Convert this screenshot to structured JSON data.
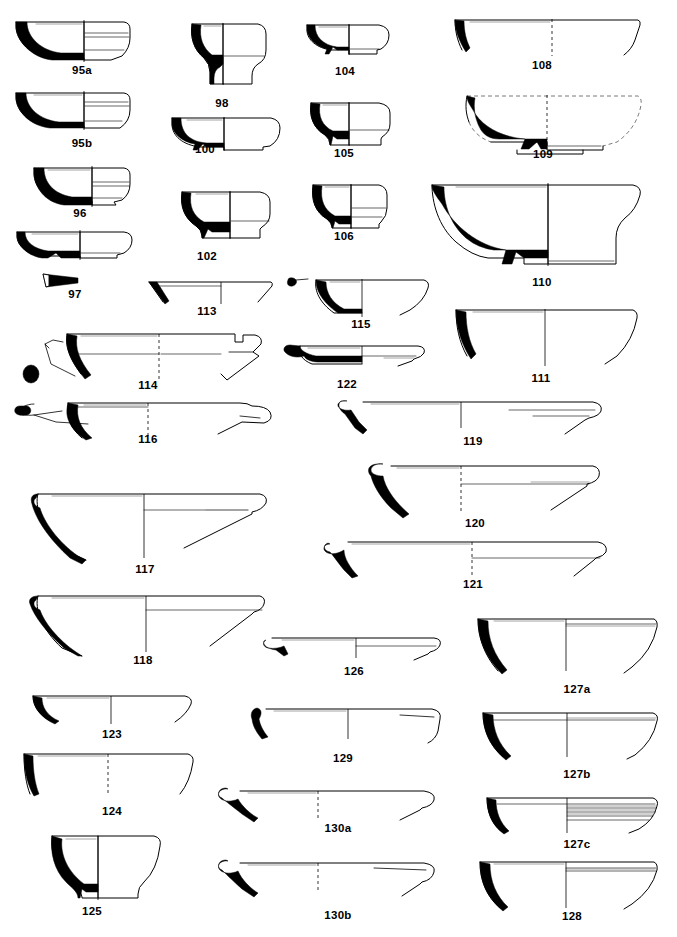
{
  "plate": {
    "kind": "archaeological-pottery-profile-plate",
    "background_color": "#ffffff",
    "ink_color": "#000000",
    "caption_color": "#000000",
    "width": 677,
    "height": 937,
    "columns": 4,
    "figure_count": 30
  },
  "figures": [
    {
      "id": "95a",
      "label": "95a",
      "column": 1,
      "caption_x": 82,
      "caption_y": 71,
      "type": "carinated-bowl-with-ring-base"
    },
    {
      "id": "95b",
      "label": "95b",
      "column": 1,
      "caption_x": 82,
      "caption_y": 144,
      "type": "carinated-bowl-with-ring-base"
    },
    {
      "id": "96",
      "label": "96",
      "column": 1,
      "caption_x": 80,
      "caption_y": 214,
      "type": "carinated-bowl-with-ring-base"
    },
    {
      "id": "97",
      "label": "97",
      "column": 1,
      "caption_x": 75,
      "caption_y": 294,
      "type": "shallow-bowl-with-base-sherd"
    },
    {
      "id": "98",
      "label": "98",
      "column": 2,
      "caption_x": 222,
      "caption_y": 104,
      "type": "pedestal-cup"
    },
    {
      "id": "100",
      "label": "100",
      "column": 2,
      "caption_x": 205,
      "caption_y": 150,
      "type": "shallow-bowl-with-disc-base"
    },
    {
      "id": "102",
      "label": "102",
      "column": 2,
      "caption_x": 207,
      "caption_y": 257,
      "type": "small-bowl-with-foot"
    },
    {
      "id": "104",
      "label": "104",
      "column": 3,
      "caption_x": 345,
      "caption_y": 72,
      "type": "shallow-bowl-with-low-ring-base"
    },
    {
      "id": "105",
      "label": "105",
      "column": 3,
      "caption_x": 344,
      "caption_y": 154,
      "type": "cup-with-flaring-foot"
    },
    {
      "id": "106",
      "label": "106",
      "column": 3,
      "caption_x": 344,
      "caption_y": 237,
      "type": "cup-with-ring-base"
    },
    {
      "id": "108",
      "label": "108",
      "column": 4,
      "caption_x": 542,
      "caption_y": 66,
      "type": "open-bowl-rim-sherd"
    },
    {
      "id": "109",
      "label": "109",
      "column": 4,
      "caption_x": 543,
      "caption_y": 155,
      "type": "reconstructed-bowl-with-ring-base"
    },
    {
      "id": "110",
      "label": "110",
      "column": 4,
      "caption_x": 542,
      "caption_y": 283,
      "type": "large-bowl-with-ring-base"
    },
    {
      "id": "111",
      "label": "111",
      "column": 4,
      "caption_x": 541,
      "caption_y": 379,
      "type": "deep-open-bowl"
    },
    {
      "id": "113",
      "label": "113",
      "column": 2,
      "caption_x": 207,
      "caption_y": 312,
      "type": "shallow-flaring-plate"
    },
    {
      "id": "114",
      "label": "114",
      "column": 1,
      "caption_x": 148,
      "caption_y": 386,
      "type": "wide-plate-with-flange"
    },
    {
      "id": "115",
      "label": "115",
      "column": 2,
      "caption_x": 361,
      "caption_y": 325,
      "type": "shallow-bowl-with-knob"
    },
    {
      "id": "116",
      "label": "116",
      "column": 1,
      "caption_x": 148,
      "caption_y": 440,
      "type": "plate-with-rolled-rim"
    },
    {
      "id": "117",
      "label": "117",
      "column": 1,
      "caption_x": 145,
      "caption_y": 570,
      "type": "deep-plate-with-thick-rim"
    },
    {
      "id": "118",
      "label": "118",
      "column": 1,
      "caption_x": 143,
      "caption_y": 661,
      "type": "large-plate"
    },
    {
      "id": "119",
      "label": "119",
      "column": 3,
      "caption_x": 473,
      "caption_y": 442,
      "type": "flat-plate-with-bevelled-rim"
    },
    {
      "id": "120",
      "label": "120",
      "column": 3,
      "caption_x": 475,
      "caption_y": 524,
      "type": "flat-plate-with-bevelled-rim"
    },
    {
      "id": "121",
      "label": "121",
      "column": 3,
      "caption_x": 473,
      "caption_y": 585,
      "type": "flat-plate-with-bevelled-rim"
    },
    {
      "id": "122",
      "label": "122",
      "column": 2,
      "caption_x": 347,
      "caption_y": 385,
      "type": "shallow-dish"
    },
    {
      "id": "123",
      "label": "123",
      "column": 1,
      "caption_x": 112,
      "caption_y": 735,
      "type": "shallow-open-bowl"
    },
    {
      "id": "124",
      "label": "124",
      "column": 1,
      "caption_x": 112,
      "caption_y": 812,
      "type": "straight-sided-bowl"
    },
    {
      "id": "125",
      "label": "125",
      "column": 1,
      "caption_x": 92,
      "caption_y": 912,
      "type": "footed-cup"
    },
    {
      "id": "126",
      "label": "126",
      "column": 2,
      "caption_x": 354,
      "caption_y": 672,
      "type": "shallow-plate"
    },
    {
      "id": "127a",
      "label": "127a",
      "column": 4,
      "caption_x": 577,
      "caption_y": 690,
      "type": "deep-hemispherical-bowl"
    },
    {
      "id": "127b",
      "label": "127b",
      "column": 4,
      "caption_x": 577,
      "caption_y": 775,
      "type": "deep-hemispherical-bowl"
    },
    {
      "id": "127c",
      "label": "127c",
      "column": 4,
      "caption_x": 577,
      "caption_y": 845,
      "type": "ribbed-bowl"
    },
    {
      "id": "128",
      "label": "128",
      "column": 4,
      "caption_x": 572,
      "caption_y": 917,
      "type": "deep-hemispherical-bowl"
    },
    {
      "id": "129",
      "label": "129",
      "column": 2,
      "caption_x": 343,
      "caption_y": 759,
      "type": "plate-with-upturned-rim"
    },
    {
      "id": "130a",
      "label": "130a",
      "column": 2,
      "caption_x": 338,
      "caption_y": 829,
      "type": "large-flat-plate"
    },
    {
      "id": "130b",
      "label": "130b",
      "column": 2,
      "caption_x": 338,
      "caption_y": 916,
      "type": "large-flat-plate"
    }
  ],
  "captions": {
    "f95a": "95a",
    "f95b": "95b",
    "f96": "96",
    "f97": "97",
    "f98": "98",
    "f100": "100",
    "f102": "102",
    "f104": "104",
    "f105": "105",
    "f106": "106",
    "f108": "108",
    "f109": "109",
    "f110": "110",
    "f111": "111",
    "f113": "113",
    "f114": "114",
    "f115": "115",
    "f116": "116",
    "f117": "117",
    "f118": "118",
    "f119": "119",
    "f120": "120",
    "f121": "121",
    "f122": "122",
    "f123": "123",
    "f124": "124",
    "f125": "125",
    "f126": "126",
    "f127a": "127a",
    "f127b": "127b",
    "f127c": "127c",
    "f128": "128",
    "f129": "129",
    "f130a": "130a",
    "f130b": "130b"
  }
}
